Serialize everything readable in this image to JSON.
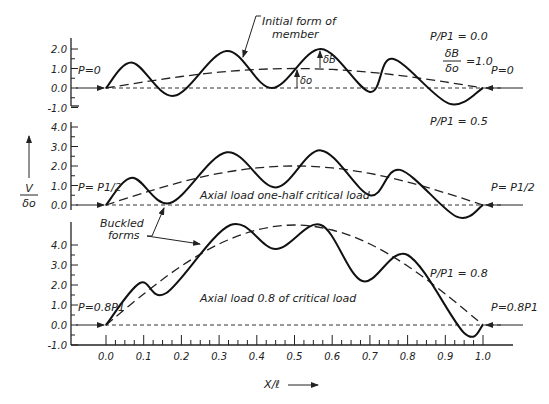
{
  "figure": {
    "y_axis_label_num": "V",
    "y_axis_label_den": "δo",
    "x_axis_label": "X/ℓ",
    "x_ticks": [
      "0.0",
      "0.1",
      "0.2",
      "0.3",
      "0.4",
      "0.5",
      "0.6",
      "0.7",
      "0.8",
      "0.9",
      "1.0"
    ],
    "annotations": {
      "initial_form": [
        "Initial form of",
        "member"
      ],
      "buckled_forms": [
        "Buckled",
        "forms"
      ],
      "delta_b": "δB",
      "delta_o": "δo",
      "ratio_num": "δB",
      "ratio_den": "δo",
      "ratio_val": "=1.0"
    }
  },
  "panels": [
    {
      "id": "top",
      "ratio_label": "P/P1 = 0.0",
      "load_left": "P=0",
      "load_right": "P=0",
      "caption": "",
      "y_ticks": [
        "2.0",
        "1.0",
        "0.0",
        "-1.0"
      ]
    },
    {
      "id": "middle",
      "ratio_label": "P/P1 = 0.5",
      "load_left": "P= P1/2",
      "load_right": "P= P1/2",
      "caption": "Axial load one-half critical load",
      "y_ticks": [
        "4.0",
        "3.0",
        "2.0",
        "1.0",
        "0.0"
      ]
    },
    {
      "id": "bottom",
      "ratio_label": "P/P1 = 0.8",
      "load_left": "P=0.8P1",
      "load_right": "P=0.8P1",
      "caption": "Axial load 0.8 of critical load",
      "y_ticks": [
        "4.0",
        "3.0",
        "2.0",
        "1.0",
        "0.0",
        "-1.0"
      ]
    }
  ],
  "chart_data": {
    "type": "line",
    "title": "",
    "xlabel": "X/ℓ",
    "ylabel": "V/δo",
    "x_range": [
      0.0,
      1.0
    ],
    "panels": [
      {
        "name": "P/P1 = 0.0",
        "ylim": [
          -1.0,
          2.0
        ],
        "series": [
          {
            "name": "Initial form of member (dashed)",
            "x": [
              0,
              0.1,
              0.2,
              0.3,
              0.4,
              0.5,
              0.6,
              0.7,
              0.8,
              0.9,
              1.0
            ],
            "y": [
              0,
              0.31,
              0.59,
              0.81,
              0.95,
              1.0,
              0.95,
              0.81,
              0.59,
              0.31,
              0
            ]
          },
          {
            "name": "Buckled form (solid)",
            "x": [
              0,
              0.07,
              0.18,
              0.32,
              0.44,
              0.57,
              0.7,
              0.76,
              0.91,
              1.0
            ],
            "y": [
              0,
              1.3,
              -0.4,
              1.9,
              0.0,
              2.0,
              -0.2,
              1.5,
              -0.8,
              0
            ]
          }
        ]
      },
      {
        "name": "P/P1 = 0.5",
        "ylim": [
          0.0,
          4.0
        ],
        "series": [
          {
            "name": "Initial form (dashed)",
            "x": [
              0,
              0.1,
              0.2,
              0.3,
              0.4,
              0.5,
              0.6,
              0.7,
              0.8,
              0.9,
              1.0
            ],
            "y": [
              0,
              0.62,
              1.18,
              1.62,
              1.9,
              2.0,
              1.9,
              1.62,
              1.18,
              0.62,
              0
            ]
          },
          {
            "name": "Buckled form (solid)",
            "x": [
              0,
              0.07,
              0.17,
              0.32,
              0.45,
              0.57,
              0.7,
              0.78,
              0.93,
              1.0
            ],
            "y": [
              0,
              1.4,
              0.1,
              2.7,
              0.9,
              2.8,
              0.5,
              1.8,
              -0.6,
              0
            ]
          }
        ]
      },
      {
        "name": "P/P1 = 0.8",
        "ylim": [
          -1.0,
          5.0
        ],
        "series": [
          {
            "name": "Initial form (dashed)",
            "x": [
              0,
              0.1,
              0.2,
              0.3,
              0.4,
              0.5,
              0.6,
              0.7,
              0.8,
              0.9,
              1.0
            ],
            "y": [
              0,
              1.55,
              2.95,
              4.05,
              4.75,
              5.0,
              4.75,
              4.05,
              2.95,
              1.55,
              0
            ]
          },
          {
            "name": "Buckled form (solid)",
            "x": [
              0,
              0.09,
              0.16,
              0.33,
              0.45,
              0.57,
              0.68,
              0.8,
              0.95,
              1.0
            ],
            "y": [
              0,
              2.1,
              1.6,
              5.0,
              3.8,
              5.0,
              2.2,
              3.5,
              -0.4,
              0
            ]
          }
        ]
      }
    ]
  }
}
